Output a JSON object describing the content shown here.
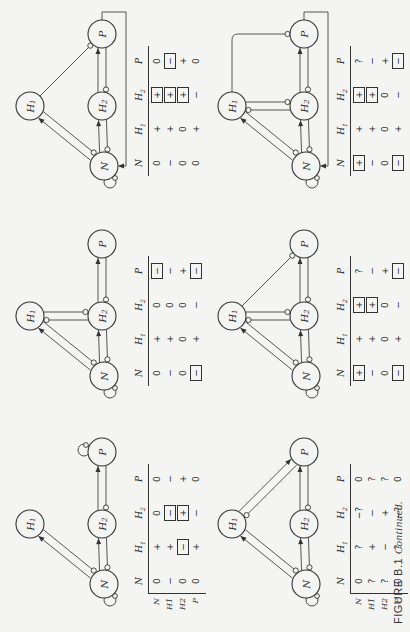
{
  "figure": {
    "caption_label": "FIGURE B.1",
    "caption_suffix": "Continued.",
    "orientation": "page rotated 90° counter-clockwise"
  },
  "nodes": {
    "N": "N",
    "H1": "H",
    "H1_sub": "1",
    "H2": "H",
    "H2_sub": "2",
    "P": "P"
  },
  "table_headers": [
    "N",
    "H1",
    "H2",
    "P"
  ],
  "row_labels": [
    "N",
    "H1",
    "H2",
    "P"
  ],
  "panels": [
    {
      "id": "a",
      "graph": {
        "self_loops": [
          "N",
          "P"
        ],
        "edges": [
          {
            "from": "N",
            "to": "H1",
            "type": "positive-and-negative"
          },
          {
            "from": "N",
            "to": "H2",
            "type": "positive-and-negative"
          },
          {
            "from": "H2",
            "to": "P",
            "type": "positive-and-negative"
          }
        ]
      },
      "show_row_labels": true,
      "table": {
        "N": [
          {
            "v": "0"
          },
          {
            "v": "−"
          },
          {
            "v": "0"
          },
          {
            "v": "0"
          }
        ],
        "H1": [
          {
            "v": "+"
          },
          {
            "v": "+"
          },
          {
            "v": "−",
            "boxed": true
          },
          {
            "v": "+"
          }
        ],
        "H2": [
          {
            "v": "0"
          },
          {
            "v": "−",
            "boxed": true
          },
          {
            "v": "+",
            "boxed": true
          },
          {
            "v": "−"
          }
        ],
        "P": [
          {
            "v": "0"
          },
          {
            "v": "−"
          },
          {
            "v": "+"
          },
          {
            "v": "0"
          }
        ]
      }
    },
    {
      "id": "b",
      "graph": {
        "self_loops": [
          "N"
        ],
        "edges": [
          {
            "from": "N",
            "to": "H1",
            "type": "positive-and-negative"
          },
          {
            "from": "N",
            "to": "H2",
            "type": "positive-and-negative"
          },
          {
            "from": "H1",
            "to": "H2",
            "type": "mutual-negative"
          },
          {
            "from": "H2",
            "to": "P",
            "type": "positive-and-negative"
          }
        ]
      },
      "show_row_labels": false,
      "table": {
        "N": [
          {
            "v": "0"
          },
          {
            "v": "−"
          },
          {
            "v": "0"
          },
          {
            "v": "−",
            "boxed": true
          }
        ],
        "H1": [
          {
            "v": "+"
          },
          {
            "v": "+"
          },
          {
            "v": "0"
          },
          {
            "v": "+"
          }
        ],
        "H2": [
          {
            "v": "0"
          },
          {
            "v": "0"
          },
          {
            "v": "0"
          },
          {
            "v": "−"
          }
        ],
        "P": [
          {
            "v": "−",
            "boxed": true
          },
          {
            "v": "−"
          },
          {
            "v": "+"
          },
          {
            "v": "−",
            "boxed": true
          }
        ]
      }
    },
    {
      "id": "c",
      "graph": {
        "self_loops": [
          "N"
        ],
        "edges": [
          {
            "from": "N",
            "to": "H1",
            "type": "positive-and-negative"
          },
          {
            "from": "N",
            "to": "H2",
            "type": "positive-and-negative"
          },
          {
            "from": "H2",
            "to": "P",
            "type": "positive-and-negative"
          },
          {
            "from": "H1",
            "to": "P",
            "type": "negative"
          },
          {
            "from": "P",
            "to": "N",
            "type": "positive"
          }
        ]
      },
      "show_row_labels": false,
      "table": {
        "N": [
          {
            "v": "0"
          },
          {
            "v": "−"
          },
          {
            "v": "0"
          },
          {
            "v": "0"
          }
        ],
        "H1": [
          {
            "v": "+"
          },
          {
            "v": "+"
          },
          {
            "v": "0"
          },
          {
            "v": "+"
          }
        ],
        "H2": [
          {
            "v": "+",
            "boxed": true
          },
          {
            "v": "+",
            "boxed": true
          },
          {
            "v": "+",
            "boxed": true
          },
          {
            "v": "−"
          }
        ],
        "P": [
          {
            "v": "0"
          },
          {
            "v": "−",
            "boxed": true
          },
          {
            "v": "+"
          },
          {
            "v": "0"
          }
        ]
      }
    },
    {
      "id": "d",
      "graph": {
        "self_loops": [
          "N"
        ],
        "edges": [
          {
            "from": "N",
            "to": "H1",
            "type": "positive-and-negative"
          },
          {
            "from": "N",
            "to": "H2",
            "type": "positive-and-negative"
          },
          {
            "from": "H2",
            "to": "P",
            "type": "positive-and-negative"
          },
          {
            "from": "H1",
            "to": "P",
            "type": "positive-and-negative"
          }
        ]
      },
      "show_row_labels": true,
      "table": {
        "N": [
          {
            "v": "0"
          },
          {
            "v": "?"
          },
          {
            "v": "?"
          },
          {
            "v": "0"
          }
        ],
        "H1": [
          {
            "v": "?"
          },
          {
            "v": "+"
          },
          {
            "v": "−"
          },
          {
            "v": "?"
          }
        ],
        "H2": [
          {
            "v": "−?"
          },
          {
            "v": "−"
          },
          {
            "v": "+"
          },
          {
            "v": "−?"
          }
        ],
        "P": [
          {
            "v": "0"
          },
          {
            "v": "?"
          },
          {
            "v": "?"
          },
          {
            "v": "0"
          }
        ]
      }
    },
    {
      "id": "e",
      "graph": {
        "self_loops": [
          "N"
        ],
        "edges": [
          {
            "from": "N",
            "to": "H1",
            "type": "positive-and-negative"
          },
          {
            "from": "N",
            "to": "H2",
            "type": "positive-and-negative"
          },
          {
            "from": "H1",
            "to": "H2",
            "type": "mutual-negative"
          },
          {
            "from": "H2",
            "to": "P",
            "type": "positive-and-negative"
          },
          {
            "from": "H1",
            "to": "P",
            "type": "negative"
          }
        ]
      },
      "show_row_labels": false,
      "table": {
        "N": [
          {
            "v": "+",
            "boxed": true
          },
          {
            "v": "−"
          },
          {
            "v": "0"
          },
          {
            "v": "−",
            "boxed": true
          }
        ],
        "H1": [
          {
            "v": "+"
          },
          {
            "v": "+"
          },
          {
            "v": "0"
          },
          {
            "v": "+"
          }
        ],
        "H2": [
          {
            "v": "+",
            "boxed": true
          },
          {
            "v": "+",
            "boxed": true
          },
          {
            "v": "0"
          },
          {
            "v": "−"
          }
        ],
        "P": [
          {
            "v": "?"
          },
          {
            "v": "−"
          },
          {
            "v": "+"
          },
          {
            "v": "−",
            "boxed": true
          }
        ]
      }
    },
    {
      "id": "f",
      "graph": {
        "self_loops": [
          "N"
        ],
        "edges": [
          {
            "from": "N",
            "to": "H1",
            "type": "positive-and-negative"
          },
          {
            "from": "N",
            "to": "H2",
            "type": "positive-and-negative"
          },
          {
            "from": "H1",
            "to": "H2",
            "type": "mutual-negative"
          },
          {
            "from": "H2",
            "to": "P",
            "type": "positive-and-negative"
          },
          {
            "from": "H1",
            "to": "P",
            "type": "negative-elbow"
          },
          {
            "from": "P",
            "to": "N",
            "type": "positive"
          }
        ]
      },
      "show_row_labels": false,
      "table": {
        "N": [
          {
            "v": "+",
            "boxed": true
          },
          {
            "v": "−"
          },
          {
            "v": "0"
          },
          {
            "v": "−",
            "boxed": true
          }
        ],
        "H1": [
          {
            "v": "+"
          },
          {
            "v": "+"
          },
          {
            "v": "0"
          },
          {
            "v": "+"
          }
        ],
        "H2": [
          {
            "v": "+",
            "boxed": true
          },
          {
            "v": "+",
            "boxed": true
          },
          {
            "v": "0"
          },
          {
            "v": "−"
          }
        ],
        "P": [
          {
            "v": "?"
          },
          {
            "v": "−"
          },
          {
            "v": "+"
          },
          {
            "v": "−",
            "boxed": true
          }
        ]
      }
    }
  ]
}
